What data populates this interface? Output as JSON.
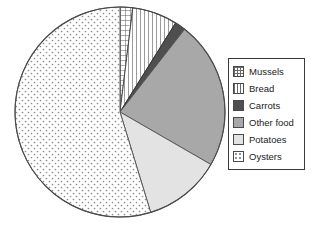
{
  "chart_data": {
    "type": "pie",
    "title": "",
    "subtitle": "",
    "xlabel": "",
    "ylabel": "",
    "legend_position": "right",
    "grid": false,
    "start_angle_deg": 0,
    "direction": "clockwise",
    "categories": [
      "Mussels",
      "Bread",
      "Carrots",
      "Other food",
      "Potatoes",
      "Oysters"
    ],
    "values": [
      2,
      7,
      1.5,
      23,
      12,
      54.5
    ],
    "units": "percent",
    "slices": [
      {
        "label": "Mussels",
        "value": 2,
        "start_deg": 0,
        "end_deg": 7,
        "pattern": "crosshatch",
        "fill": "#ffffff",
        "stroke": "#4a4a4a"
      },
      {
        "label": "Bread",
        "value": 7,
        "start_deg": 7,
        "end_deg": 32,
        "pattern": "vertical-lines",
        "fill": "#ffffff",
        "stroke": "#4a4a4a"
      },
      {
        "label": "Carrots",
        "value": 1.5,
        "start_deg": 32,
        "end_deg": 38,
        "pattern": "solid",
        "fill": "#4f4f4f",
        "stroke": "#333333"
      },
      {
        "label": "Other food",
        "value": 23,
        "start_deg": 38,
        "end_deg": 120,
        "pattern": "solid",
        "fill": "#a8a8a8",
        "stroke": "#5a5a5a"
      },
      {
        "label": "Potatoes",
        "value": 12,
        "start_deg": 120,
        "end_deg": 163,
        "pattern": "solid",
        "fill": "#e3e3e3",
        "stroke": "#5a5a5a"
      },
      {
        "label": "Oysters",
        "value": 54.5,
        "start_deg": 163,
        "end_deg": 360,
        "pattern": "fine-dots",
        "fill": "#ffffff",
        "stroke": "#5a5a5a"
      }
    ],
    "geometry": {
      "center_x": 120,
      "center_y": 112,
      "radius": 105
    }
  },
  "legend": {
    "items": [
      {
        "label": "Mussels",
        "pattern": "crosshatch",
        "swatch_name": "swatch-mussels"
      },
      {
        "label": "Bread",
        "pattern": "vertical-lines",
        "swatch_name": "swatch-bread"
      },
      {
        "label": "Carrots",
        "pattern": "solid-dark",
        "swatch_name": "swatch-carrots"
      },
      {
        "label": "Other food",
        "pattern": "solid-medium",
        "swatch_name": "swatch-other-food"
      },
      {
        "label": "Potatoes",
        "pattern": "solid-light",
        "swatch_name": "swatch-potatoes"
      },
      {
        "label": "Oysters",
        "pattern": "fine-dots",
        "swatch_name": "swatch-oysters"
      }
    ]
  },
  "colors": {
    "carrots": "#4f4f4f",
    "other_food": "#a8a8a8",
    "potatoes": "#e3e3e3",
    "white": "#ffffff",
    "outline": "#4a4a4a"
  }
}
